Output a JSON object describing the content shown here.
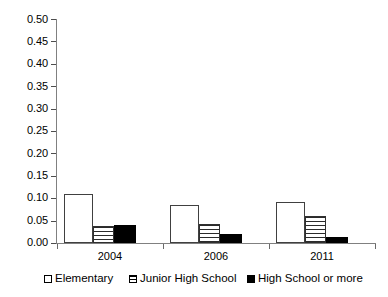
{
  "chart_data": {
    "type": "bar",
    "title": "",
    "subtitle": "",
    "xlabel": "",
    "ylabel": "",
    "categories": [
      "2004",
      "2006",
      "2011"
    ],
    "series": [
      {
        "name": "Elementary",
        "key": "elementary",
        "style": "white",
        "values": [
          0.11,
          0.085,
          0.092
        ]
      },
      {
        "name": "Junior High School",
        "key": "junior",
        "style": "horizontal-stripes",
        "values": [
          0.037,
          0.043,
          0.06
        ]
      },
      {
        "name": "High School or more",
        "key": "high",
        "style": "black",
        "values": [
          0.04,
          0.02,
          0.013
        ]
      }
    ],
    "ylim": [
      0.0,
      0.5
    ],
    "ytick_step": 0.05,
    "ytick_labels": [
      "0.50",
      "0.45",
      "0.40",
      "0.35",
      "0.30",
      "0.25",
      "0.20",
      "0.15",
      "0.10",
      "0.05",
      "0.00"
    ],
    "ytick_values": [
      0.5,
      0.45,
      0.4,
      0.35,
      0.3,
      0.25,
      0.2,
      0.15,
      0.1,
      0.05,
      0.0
    ],
    "grid": false,
    "legend_position": "bottom",
    "colors": {
      "elementary": "#ffffff",
      "junior": "#2b2b2b",
      "high": "#000000",
      "axis": "#808080",
      "text": "#000000",
      "background": "#ffffff"
    }
  },
  "legend": {
    "items": [
      {
        "label": "Elementary"
      },
      {
        "label": "Junior High School"
      },
      {
        "label": "High School or more"
      }
    ]
  },
  "x_axis": {
    "labels": [
      "2004",
      "2006",
      "2011"
    ]
  }
}
